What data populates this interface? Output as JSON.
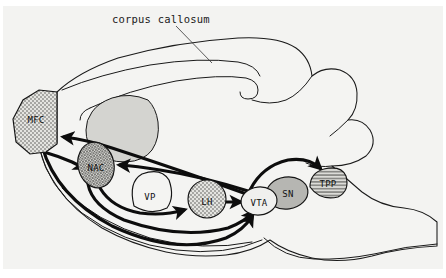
{
  "figure": {
    "title": "corpus callosum",
    "type": "sagittal-brain-circuit-diagram",
    "background_color": "#f2f2f0",
    "line_color": "#1a1a1a"
  },
  "callouts": [
    {
      "id": "corpus-callosum",
      "label": "corpus callosum",
      "text_x": 112,
      "text_y": 20,
      "leader": "M 176 26 L 212 63"
    }
  ],
  "regions": [
    {
      "id": "mfc",
      "label": "MFC",
      "full_name": "medial frontal cortex",
      "fill_pattern": "stipple-dots",
      "fill_color": "#dcdcd8",
      "label_x": 36,
      "label_y": 120,
      "shape": "M 57 92 L 57 143 L 46 151 L 28 153 L 14 141 L 12 118 L 22 99 L 38 90 Z"
    },
    {
      "id": "nac",
      "label": "NAC",
      "full_name": "nucleus accumbens",
      "fill_pattern": "crosshatch-fine",
      "fill_color": "#c9c9c4",
      "label_x": 96,
      "label_y": 168,
      "shape": "ellipse",
      "cx": 96,
      "cy": 165,
      "rx": 18,
      "ry": 23,
      "rot": -12
    },
    {
      "id": "vp",
      "label": "VP",
      "full_name": "ventral pallidum",
      "fill_pattern": "none",
      "fill_color": "#f4f4f2",
      "label_x": 150,
      "label_y": 197,
      "shape": "M 134 206 Q 129 182 142 175 Q 160 168 168 180 Q 174 196 167 207 Q 152 215 134 206 Z"
    },
    {
      "id": "lh",
      "label": "LH",
      "full_name": "lateral hypothalamus",
      "fill_pattern": "stipple-dots",
      "fill_color": "#dcdcd8",
      "label_x": 207,
      "label_y": 202,
      "shape": "circle",
      "cx": 207,
      "cy": 199,
      "rx": 19,
      "ry": 19,
      "rot": 0
    },
    {
      "id": "vta",
      "label": "VTA",
      "full_name": "ventral tegmental area",
      "fill_pattern": "none",
      "fill_color": "#f0f0ee",
      "label_x": 259,
      "label_y": 203,
      "shape": "ellipse",
      "cx": 259,
      "cy": 201,
      "rx": 18,
      "ry": 14,
      "rot": -6
    },
    {
      "id": "sn",
      "label": "SN",
      "full_name": "substantia nigra",
      "fill_pattern": "solid-gray",
      "fill_color": "#b4b4b0",
      "label_x": 287,
      "label_y": 194,
      "shape": "ellipse",
      "cx": 287,
      "cy": 193,
      "rx": 21,
      "ry": 16,
      "rot": -8
    },
    {
      "id": "tpp",
      "label": "TPP",
      "full_name": "tegmental pedunculopontine nucleus",
      "fill_pattern": "horizontal-hatch",
      "fill_color": "#c6c6c2",
      "label_x": 327,
      "label_y": 184,
      "shape": "M 310 187 Q 311 174 324 170 Q 340 166 345 176 Q 349 190 338 196 Q 320 200 310 187 Z"
    }
  ],
  "shaded_areas": [
    {
      "id": "septum-shading",
      "fill_color": "#d2d2ce"
    },
    {
      "id": "corpus-callosum-body",
      "fill_color": "#f4f4f2"
    }
  ],
  "pathways": [
    {
      "id": "vta-to-mfc",
      "from": "VTA",
      "to": "MFC",
      "arrowhead": "end"
    },
    {
      "id": "vta-to-nac",
      "from": "VTA",
      "to": "NAC",
      "arrowhead": "end"
    },
    {
      "id": "mfc-to-nac",
      "from": "MFC",
      "to": "NAC",
      "arrowhead": "end"
    },
    {
      "id": "nac-to-vta",
      "from": "NAC",
      "to": "VTA",
      "arrowhead": "end"
    },
    {
      "id": "nac-to-lh",
      "from": "NAC",
      "to": "LH",
      "arrowhead": "end"
    },
    {
      "id": "lh-to-vta",
      "from": "LH",
      "to": "VTA",
      "arrowhead": "end"
    },
    {
      "id": "mfc-to-vta",
      "from": "MFC",
      "to": "VTA",
      "arrowhead": "end"
    },
    {
      "id": "vta-to-tpp",
      "from": "VTA",
      "to": "TPP",
      "arrowhead": "end"
    }
  ]
}
